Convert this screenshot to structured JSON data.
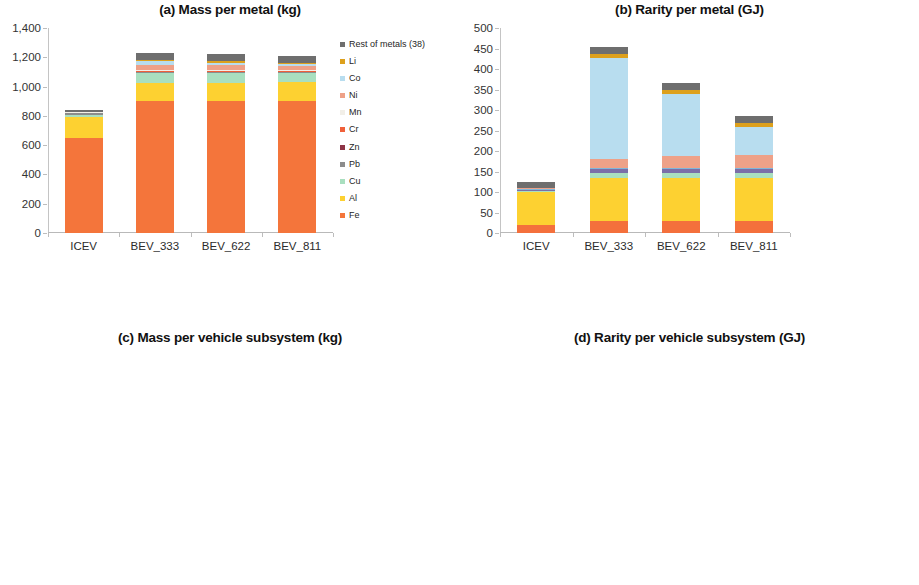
{
  "figure": {
    "panels": [
      "a",
      "b",
      "c",
      "d"
    ]
  },
  "chart_data": [
    {
      "id": "a",
      "type": "bar",
      "stacked": true,
      "title": "(a) Mass per metal (kg)",
      "xlabel": "",
      "ylabel": "",
      "ylim": [
        0,
        1400
      ],
      "yticks": [
        "0",
        "200",
        "400",
        "600",
        "800",
        "1,000",
        "1,200",
        "1,400"
      ],
      "ytick_values": [
        0,
        200,
        400,
        600,
        800,
        1000,
        1200,
        1400
      ],
      "grid": false,
      "legend_position": "right",
      "categories": [
        "ICEV",
        "BEV_333",
        "BEV_622",
        "BEV_811"
      ],
      "series": [
        {
          "name": "Fe",
          "color": "#F4753B",
          "values": [
            648,
            900,
            900,
            900
          ]
        },
        {
          "name": "Al",
          "color": "#FDD131",
          "values": [
            145,
            128,
            128,
            128
          ]
        },
        {
          "name": "Cu",
          "color": "#A9DFBF",
          "values": [
            15,
            63,
            63,
            63
          ]
        },
        {
          "name": "Pb",
          "color": "#8C8C8C",
          "values": [
            9,
            9,
            9,
            9
          ]
        },
        {
          "name": "Zn",
          "color": "#8E3446",
          "values": [
            3,
            3,
            3,
            3
          ]
        },
        {
          "name": "Cr",
          "color": "#F0603A",
          "values": [
            3,
            3,
            3,
            3
          ]
        },
        {
          "name": "Mn",
          "color": "#F2EFE8",
          "values": [
            4,
            8,
            7,
            6
          ]
        },
        {
          "name": "Ni",
          "color": "#EEA188",
          "values": [
            2,
            36,
            34,
            32
          ]
        },
        {
          "name": "Co",
          "color": "#B8DDEF",
          "values": [
            1,
            26,
            16,
            9
          ]
        },
        {
          "name": "Li",
          "color": "#DDA01C",
          "values": [
            0,
            9,
            9,
            9
          ]
        },
        {
          "name": "Rest of metals (38)",
          "color": "#6E6E6E",
          "values": [
            8,
            48,
            50,
            50
          ]
        }
      ],
      "totals": [
        838,
        1233,
        1222,
        1212
      ]
    },
    {
      "id": "b",
      "type": "bar",
      "stacked": true,
      "title": "(b) Rarity per metal (GJ)",
      "xlabel": "",
      "ylabel": "",
      "ylim": [
        0,
        500
      ],
      "yticks": [
        "0",
        "50",
        "100",
        "150",
        "200",
        "250",
        "300",
        "350",
        "400",
        "450",
        "500"
      ],
      "ytick_values": [
        0,
        50,
        100,
        150,
        200,
        250,
        300,
        350,
        400,
        450,
        500
      ],
      "grid": false,
      "legend_position": "right",
      "categories": [
        "ICEV",
        "BEV_333",
        "BEV_622",
        "BEV_811"
      ],
      "series": [
        {
          "name": "Fe",
          "color": "#F4703C",
          "values": [
            20,
            29,
            29,
            29
          ]
        },
        {
          "name": "Al",
          "color": "#FDD131",
          "values": [
            79,
            105,
            105,
            105
          ]
        },
        {
          "name": "Cu",
          "color": "#A9DFBF",
          "values": [
            3,
            12,
            12,
            12
          ]
        },
        {
          "name": "Ta",
          "color": "#7B6FA8",
          "values": [
            3,
            10,
            10,
            10
          ]
        },
        {
          "name": "Pd",
          "color": "#7FB6D9",
          "values": [
            2,
            2,
            2,
            2
          ]
        },
        {
          "name": "Ni",
          "color": "#EEA188",
          "values": [
            2,
            22,
            29,
            32
          ]
        },
        {
          "name": "Co",
          "color": "#B8DDEF",
          "values": [
            1,
            247,
            152,
            69
          ]
        },
        {
          "name": "Li",
          "color": "#DDA01C",
          "values": [
            0,
            10,
            10,
            10
          ]
        },
        {
          "name": "Rest of metals (40)",
          "color": "#6E6E6E",
          "values": [
            14,
            17,
            17,
            17
          ]
        }
      ],
      "totals": [
        124,
        454,
        352,
        278
      ]
    },
    {
      "id": "c",
      "type": "bar",
      "stacked": true,
      "title": "(c) Mass per vehicle subsystem (kg)",
      "xlabel": "",
      "ylabel": "",
      "ylim": [
        0,
        1400
      ],
      "yticks": [
        "0",
        "200",
        "400",
        "600",
        "800",
        "1,000",
        "1,200",
        "1,400"
      ],
      "ytick_values": [
        0,
        200,
        400,
        600,
        800,
        1000,
        1200,
        1400
      ],
      "grid": false,
      "legend_position": "right",
      "categories": [
        "ICEV",
        "BEV_333",
        "BEV_622",
        "BEV_811"
      ],
      "series": [
        {
          "name": "Engine",
          "color": "#3B3330",
          "values": [
            78,
            0,
            0,
            0
          ]
        },
        {
          "name": "Fuel tank & Exhaust",
          "color": "#943243",
          "values": [
            30,
            0,
            0,
            0
          ]
        },
        {
          "name": "Transmission",
          "color": "#C9E8F5",
          "values": [
            8,
            8,
            8,
            8
          ]
        },
        {
          "name": "Front axle",
          "color": "#3A6F9E",
          "values": [
            95,
            138,
            138,
            138
          ]
        },
        {
          "name": "Rear axle",
          "color": "#A6A6A6",
          "values": [
            30,
            42,
            42,
            42
          ]
        },
        {
          "name": "Wheels & Brakes",
          "color": "#F5D83B",
          "values": [
            113,
            96,
            96,
            96
          ]
        },
        {
          "name": "Selector mechanism",
          "color": "#9FC5E8",
          "values": [
            2,
            2,
            2,
            2
          ]
        },
        {
          "name": "Body",
          "color": "#FB9024",
          "values": [
            410,
            595,
            593,
            590
          ]
        },
        {
          "name": "Electrics & Electronics",
          "color": "#82B43C",
          "values": [
            60,
            340,
            331,
            324
          ]
        },
        {
          "name": "Accessories",
          "color": "#3B2B33",
          "values": [
            12,
            12,
            12,
            12
          ]
        }
      ],
      "totals": [
        838,
        1233,
        1222,
        1212
      ]
    },
    {
      "id": "d",
      "type": "bar",
      "stacked": true,
      "title": "(d) Rarity per vehicle subsystem (GJ)",
      "xlabel": "",
      "ylabel": "",
      "ylim": [
        0,
        500
      ],
      "yticks": [
        "0",
        "50",
        "100",
        "150",
        "200",
        "250",
        "300",
        "350",
        "400",
        "450",
        "500"
      ],
      "ytick_values": [
        0,
        50,
        100,
        150,
        200,
        250,
        300,
        350,
        400,
        450,
        500
      ],
      "grid": false,
      "legend_position": "right",
      "categories": [
        "ICEV",
        "BEV_333",
        "BEV_622",
        "BEV_811"
      ],
      "series": [
        {
          "name": "Engine",
          "color": "#3B3330",
          "values": [
            33,
            0,
            0,
            0
          ]
        },
        {
          "name": "Fuel tank & Exhaust",
          "color": "#943243",
          "values": [
            2,
            0,
            0,
            0
          ]
        },
        {
          "name": "Transmission",
          "color": "#C9E8F5",
          "values": [
            1,
            1,
            1,
            1
          ]
        },
        {
          "name": "Front axle",
          "color": "#3A6F9E",
          "values": [
            12,
            16,
            16,
            16
          ]
        },
        {
          "name": "Rear axle",
          "color": "#A6A6A6",
          "values": [
            2,
            3,
            3,
            3
          ]
        },
        {
          "name": "Wheels & Brakes",
          "color": "#F5D83B",
          "values": [
            30,
            26,
            26,
            26
          ]
        },
        {
          "name": "Selector mechanism",
          "color": "#9FC5E8",
          "values": [
            1,
            1,
            1,
            1
          ]
        },
        {
          "name": "Body",
          "color": "#FB9024",
          "values": [
            30,
            39,
            39,
            39
          ]
        },
        {
          "name": "Electrics & Electronics",
          "color": "#82B43C",
          "values": [
            6,
            361,
            257,
            184
          ]
        },
        {
          "name": "Accessories",
          "color": "#3B2B33",
          "values": [
            2,
            2,
            2,
            2
          ]
        }
      ],
      "totals": [
        119,
        449,
        345,
        272
      ]
    }
  ]
}
